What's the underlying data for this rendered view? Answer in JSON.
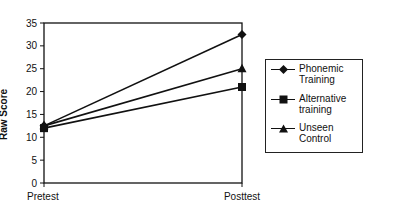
{
  "chart_data": {
    "type": "line",
    "title": "",
    "xlabel": "",
    "ylabel": "Raw Score",
    "categories": [
      "Pretest",
      "Posttest"
    ],
    "ylim": [
      0,
      35
    ],
    "yticks": [
      0,
      5,
      10,
      15,
      20,
      25,
      30,
      35
    ],
    "grid": false,
    "legend_position": "right",
    "series": [
      {
        "name": "Phonemic Training",
        "marker": "diamond",
        "values": [
          12.5,
          32.5
        ]
      },
      {
        "name": "Alternative training",
        "marker": "square",
        "values": [
          12,
          21
        ]
      },
      {
        "name": "Unseen Control",
        "marker": "triangle",
        "values": [
          12.5,
          25
        ]
      }
    ]
  },
  "legend": {
    "items": [
      {
        "line1": "Phonemic",
        "line2": "Training"
      },
      {
        "line1": "Alternative",
        "line2": "training"
      },
      {
        "line1": "Unseen",
        "line2": "Control"
      }
    ]
  }
}
